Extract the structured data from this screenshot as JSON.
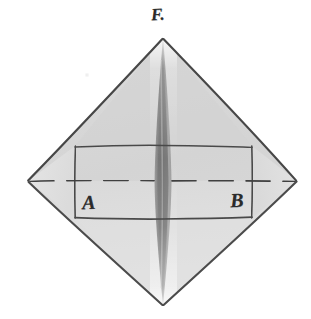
{
  "figure": {
    "kind": "hand-drawn-geometric-diagram",
    "background_color": "#ffffff",
    "paper_tone": "#fdfdfd",
    "ink_color": "#3a3a3a",
    "labels": {
      "apex": "F.",
      "left_interior": "A",
      "right_interior": "B"
    },
    "geometry": {
      "outline_name": "diamond-outline",
      "vertices": {
        "top": [
          163,
          38
        ],
        "right": [
          297,
          181
        ],
        "bottom": [
          163,
          306
        ],
        "left": [
          28,
          181
        ]
      },
      "inner_rectangle": {
        "left": 75,
        "right": 252,
        "top": 146,
        "bottom": 218
      },
      "dashed_axis": {
        "y": 181,
        "x_start": 28,
        "x_end": 297,
        "dash_pattern": "22 11"
      },
      "center_spindle": {
        "top": [
          163,
          38
        ],
        "bottom": [
          163,
          306
        ],
        "max_half_width": 8,
        "widest_y": 182
      }
    },
    "fills": {
      "upper_wash": "#d6d6d6",
      "lower_wash": "#dcdcdc",
      "side_wash": "#e0e0e0",
      "spindle_dark": "#8d8d8d",
      "spindle_core": "#7a7a7a",
      "spindle_highlight": "#b5b5b5"
    },
    "stroke_widths": {
      "outline": 2.0,
      "inner_rectangle": 1.6,
      "dashed_axis": 1.6,
      "spindle_edge": 1.2
    }
  }
}
